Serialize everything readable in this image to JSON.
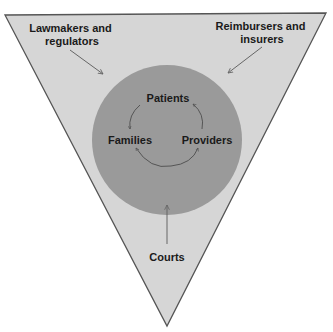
{
  "diagram": {
    "type": "stakeholder-triangle",
    "colors": {
      "triangle_fill": "#d6d6d6",
      "triangle_stroke": "#555555",
      "circle_fill": "#9a9a9a",
      "arrow": "#666666",
      "text": "#1a1a1a"
    },
    "outer": {
      "top_left": {
        "line1": "Lawmakers and",
        "line2": "regulators"
      },
      "top_right": {
        "line1": "Reimbursers and",
        "line2": "insurers"
      },
      "bottom": {
        "label": "Courts"
      }
    },
    "inner": {
      "top": "Patients",
      "left": "Families",
      "right": "Providers"
    }
  }
}
